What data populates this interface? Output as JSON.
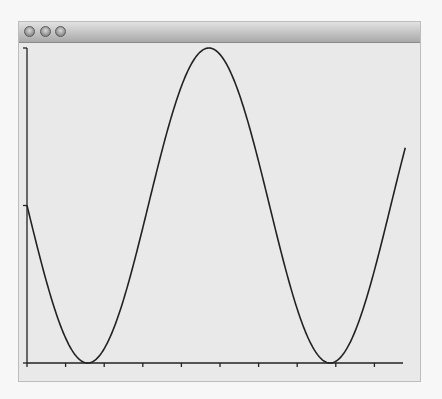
{
  "window": {
    "title": "",
    "buttons": [
      {
        "name": "close-button"
      },
      {
        "name": "minimize-button"
      },
      {
        "name": "zoom-button"
      }
    ]
  },
  "colors": {
    "line": "#222222",
    "axis": "#222222",
    "background": "#e9e9e9"
  },
  "chart_data": {
    "type": "line",
    "title": "",
    "xlabel": "",
    "ylabel": "",
    "function": "y = 1 - sin(x)",
    "xlim": [
      0,
      9.8
    ],
    "ylim": [
      0,
      2
    ],
    "x_ticks": [
      0,
      1,
      2,
      3,
      4,
      5,
      6,
      7,
      8,
      9
    ],
    "y_ticks": [
      0,
      1,
      2
    ],
    "tick_labels_visible": false,
    "grid": false,
    "legend": null,
    "series": [
      {
        "name": "curve",
        "x": [
          0,
          0.5,
          1,
          1.5708,
          2,
          2.5,
          3,
          3.5,
          4,
          4.5,
          4.7124,
          5,
          5.5,
          6,
          6.5,
          7,
          7.5,
          7.854,
          8,
          8.5,
          9,
          9.5,
          9.8
        ],
        "values": [
          1.0,
          0.52,
          0.16,
          0.0,
          0.09,
          0.4,
          0.86,
          1.35,
          1.76,
          1.98,
          2.0,
          1.96,
          1.71,
          1.28,
          0.78,
          0.34,
          0.06,
          0.0,
          0.01,
          0.2,
          0.59,
          1.08,
          1.37
        ]
      }
    ]
  }
}
